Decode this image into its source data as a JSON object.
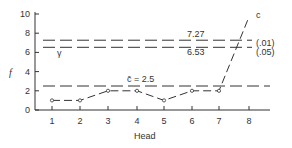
{
  "chart_data": {
    "type": "line",
    "title": "",
    "xlabel": "Head",
    "ylabel": "f",
    "categories": [
      "1",
      "2",
      "3",
      "4",
      "5",
      "6",
      "7",
      "8"
    ],
    "x": [
      1,
      2,
      3,
      4,
      5,
      6,
      7,
      8
    ],
    "series": [
      {
        "name": "c",
        "values": [
          1,
          1,
          2,
          2,
          1,
          2,
          2,
          9.7
        ],
        "marker": "open-circle",
        "line": "dashed",
        "end_label": "c"
      }
    ],
    "yticks": [
      0,
      2,
      4,
      6,
      8,
      10
    ],
    "ylim": [
      0,
      10.5
    ],
    "xlim": [
      0.5,
      8.5
    ],
    "grid": false,
    "reference_lines": [
      {
        "y": 7.27,
        "label": "7.27",
        "side_label": "(.01)"
      },
      {
        "y": 6.53,
        "label": "6.53",
        "side_label": "(.05)"
      },
      {
        "y": 2.5,
        "label": "c̄ = 2.5"
      }
    ],
    "annotations": [
      {
        "text": "γ",
        "x": 1.6,
        "y": 5.0
      }
    ]
  },
  "labels": {
    "ylabel": "f",
    "xlabel": "Head",
    "gamma": "γ",
    "cbar": "c̄ = 2.5",
    "l727": "7.27",
    "l653": "6.53",
    "p01": "(.01)",
    "p05": "(.05)",
    "series_end": "c"
  }
}
